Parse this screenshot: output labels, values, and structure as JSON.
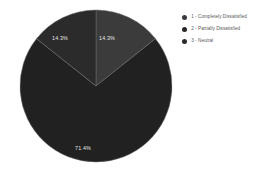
{
  "chart_data": {
    "type": "pie",
    "title": "",
    "categories": [
      "1 - Completely Dissatisfied",
      "2 - Partially Dissatisfied",
      "3 - Neutral"
    ],
    "values": [
      14.3,
      71.4,
      14.3
    ],
    "value_labels": [
      "14.3%",
      "71.4%",
      "14.3%"
    ],
    "units": "percent",
    "colors": [
      "#3b3b3b",
      "#212121",
      "#2b2b2b"
    ],
    "legend_position": "right",
    "grid": false,
    "xlabel": "",
    "ylabel": "",
    "start_angle_deg": 0,
    "direction": "clockwise",
    "slices": [
      {
        "name": "1 - Completely Dissatisfied",
        "value": 14.3,
        "label": "14.3%",
        "color": "#3b3b3b",
        "start_deg": 0,
        "end_deg": 51.48,
        "label_x": 107,
        "label_y": 39
      },
      {
        "name": "2 - Partially Dissatisfied",
        "value": 71.4,
        "label": "71.4%",
        "color": "#212121",
        "start_deg": 51.48,
        "end_deg": 308.52,
        "label_x": 83,
        "label_y": 149
      },
      {
        "name": "3 - Neutral",
        "value": 14.3,
        "label": "14.3%",
        "color": "#2b2b2b",
        "start_deg": 308.52,
        "end_deg": 360,
        "label_x": 60,
        "label_y": 39
      }
    ]
  },
  "legend": {
    "items": [
      {
        "label": "1 - Completely Dissatisfied",
        "color": "#3b3b3b"
      },
      {
        "label": "2 - Partially Dissatisfied",
        "color": "#262626"
      },
      {
        "label": "3 - Neutral",
        "color": "#2b2b2b"
      }
    ]
  }
}
